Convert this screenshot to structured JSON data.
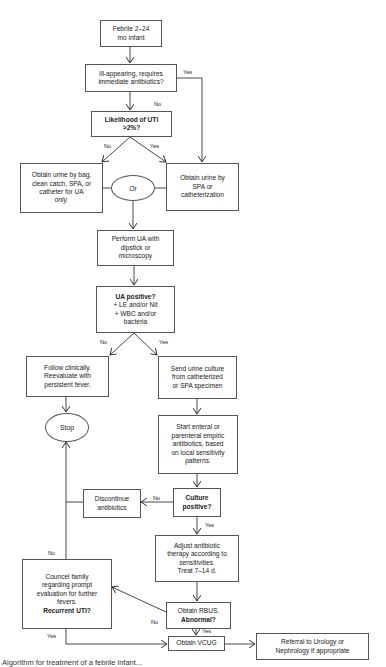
{
  "flowchart": {
    "nodes": {
      "febrile": {
        "lines": [
          "Febrile 2–24",
          "mo infant"
        ]
      },
      "ill_appearing": {
        "lines": [
          "Ill-appearing, requires",
          "immediate antibiotics?"
        ]
      },
      "likelihood": {
        "lines": [
          "Likelihood of UTI",
          ">2%?"
        ]
      },
      "urine_bag": {
        "lines": [
          "Obtain urine by bag,",
          "clean catch, SPA, or",
          "catheter for UA"
        ],
        "italic_line": "only."
      },
      "urine_spa": {
        "lines": [
          "Obtain urine by",
          "SPA or",
          "catheterization"
        ]
      },
      "or": {
        "label": "Or"
      },
      "perform_ua": {
        "lines": [
          "Perform UA with",
          "dipstick or",
          "microscopy"
        ]
      },
      "ua_positive": {
        "title": "UA positive?",
        "lines": [
          "+ LE and/or Nit",
          "+ WBC and/or",
          "bacteria"
        ]
      },
      "follow_clinically": {
        "lines": [
          "Follow clinically.",
          "Reevaluate with",
          "persistent fever."
        ]
      },
      "send_culture": {
        "lines": [
          "Send urine culture",
          "from catheterized",
          "or SPA specimen"
        ]
      },
      "stop": {
        "label": "Stop"
      },
      "start_antibiotics": {
        "lines": [
          "Start enteral or",
          "parenteral empiric",
          "antibiotics, based",
          "on local sensitivity",
          "patterns."
        ]
      },
      "discontinue": {
        "lines": [
          "Discontinue",
          "antibiotics"
        ]
      },
      "culture_positive": {
        "lines": [
          "Culture",
          "positive?"
        ]
      },
      "adjust": {
        "lines": [
          "Adjust antibiotic",
          "therapy according to",
          "sensitivities.",
          "Treat 7–14 d."
        ]
      },
      "council": {
        "lines": [
          "Councel family",
          "regarding prompt",
          "evaluation for further",
          "fevers."
        ],
        "bold_line": "Recurrent UTI?"
      },
      "rbus": {
        "line": "Obtain RBUS.",
        "bold_line": "Abnormal?"
      },
      "vcug": {
        "line": "Obtain VCUG"
      },
      "referral": {
        "lines": [
          "Referral to Urology or",
          "Nephrology if appropriate"
        ]
      }
    },
    "edge_labels": {
      "ill_yes": "Yes",
      "ill_no": "No",
      "likelihood_no": "No",
      "likelihood_yes": "Yes",
      "ua_no": "No",
      "ua_yes": "Yes",
      "culture_no": "No",
      "culture_yes": "Yes",
      "recurrent_no": "No",
      "recurrent_yes": "Yes",
      "rbus_no": "No",
      "rbus_yes": "Yes"
    },
    "colors": {
      "line": "#333333",
      "border": "#555555",
      "background": "#ffffff"
    }
  },
  "caption": "Algorithm for treatment of a febrile infant..."
}
